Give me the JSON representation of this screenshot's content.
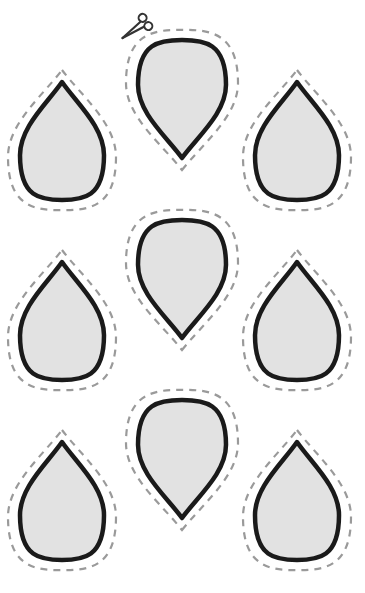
{
  "worksheet": {
    "title": "Teardrop cut-out shapes",
    "layout": {
      "columns": 3,
      "rows": 3
    },
    "colors": {
      "background": "#ffffff",
      "shape_fill": "#e2e2e2",
      "outline": "#1a1a1a",
      "cut_line": "#9a9a9a",
      "scissors": "#333333"
    },
    "scissors_icon": {
      "name": "scissors-icon",
      "x": 134,
      "y": 30
    },
    "shapes": [
      {
        "id": "shape-r1-c1",
        "cx": 62,
        "top": 82,
        "bottom": 200,
        "half_width": 42,
        "orientation": "up"
      },
      {
        "id": "shape-r1-c2",
        "cx": 182,
        "top": 40,
        "bottom": 158,
        "half_width": 44,
        "orientation": "down"
      },
      {
        "id": "shape-r1-c3",
        "cx": 297,
        "top": 82,
        "bottom": 200,
        "half_width": 42,
        "orientation": "up"
      },
      {
        "id": "shape-r2-c1",
        "cx": 62,
        "top": 262,
        "bottom": 380,
        "half_width": 42,
        "orientation": "up"
      },
      {
        "id": "shape-r2-c2",
        "cx": 182,
        "top": 220,
        "bottom": 338,
        "half_width": 44,
        "orientation": "down"
      },
      {
        "id": "shape-r2-c3",
        "cx": 297,
        "top": 262,
        "bottom": 380,
        "half_width": 42,
        "orientation": "up"
      },
      {
        "id": "shape-r3-c1",
        "cx": 62,
        "top": 442,
        "bottom": 560,
        "half_width": 42,
        "orientation": "up"
      },
      {
        "id": "shape-r3-c2",
        "cx": 182,
        "top": 400,
        "bottom": 518,
        "half_width": 44,
        "orientation": "down"
      },
      {
        "id": "shape-r3-c3",
        "cx": 297,
        "top": 442,
        "bottom": 560,
        "half_width": 42,
        "orientation": "up"
      }
    ]
  }
}
